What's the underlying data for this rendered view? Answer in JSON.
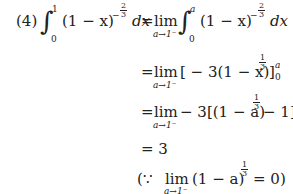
{
  "problem": {
    "label": "(4)",
    "lines": [
      {
        "lhs": "∫₀¹ (1−x)^(−2/3) dx",
        "rhs": "= lim_{a→1⁻} ∫₀ᵃ (1−x)^(−2/3) dx"
      },
      {
        "rhs": "= lim_{a→1⁻} [−3(1−x)^(1/3)]₀ᵃ"
      },
      {
        "rhs": "= lim_{a→1⁻} −3[(1−a)^(1/3) − 1]"
      },
      {
        "rhs": "= 3"
      },
      {
        "rhs": "(∵ lim_{a→1⁻} (1−a)^(1/3) = 0)"
      }
    ],
    "tokens": {
      "label": "(4)",
      "int_lower": "0",
      "int_upper_1": "1",
      "int_upper_a": "a",
      "base": "(1 − x)",
      "base_a": "(1 − a)",
      "exp_neg_num": "2",
      "exp_den": "3",
      "exp_neg_sign": "−",
      "exp_pos_num": "1",
      "dx": "dx",
      "eq": "=",
      "lim": "lim",
      "lim_sub": "a→1⁻",
      "line2_body": "[ − 3(1 − x)",
      "line2_bounds_upper": "a",
      "line2_bounds_lower": "0",
      "line2_close": "]",
      "line3_body_pre": " − 3[(1 − a)",
      "line3_body_post": " − 1]",
      "line4": "= 3",
      "because_open": "(∵",
      "because_close": "= 0)"
    }
  }
}
